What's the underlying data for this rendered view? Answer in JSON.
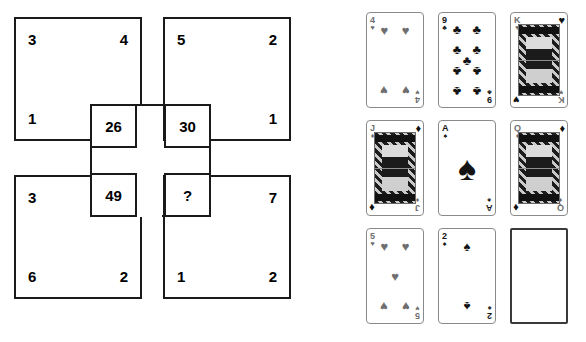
{
  "puzzle": {
    "squares": [
      {
        "id": "top-left",
        "top_left": "3",
        "top_right": "4",
        "bottom_left": "1",
        "bottom_right": ""
      },
      {
        "id": "top-right",
        "top_left": "5",
        "top_right": "2",
        "bottom_left": "",
        "bottom_right": "1"
      },
      {
        "id": "bottom-left",
        "top_left": "3",
        "top_right": "",
        "bottom_left": "6",
        "bottom_right": "2"
      },
      {
        "id": "bottom-right",
        "top_left": "",
        "top_right": "7",
        "bottom_left": "1",
        "bottom_right": "2"
      }
    ],
    "center_cells": [
      {
        "id": "cell-26",
        "value": "26"
      },
      {
        "id": "cell-30",
        "value": "30"
      },
      {
        "id": "cell-49",
        "value": "49"
      },
      {
        "id": "cell-q",
        "value": "?"
      }
    ]
  },
  "cards": {
    "rows": [
      [
        {
          "rank": "4",
          "suit_name": "hearts",
          "suit_glyph": "♥",
          "color": "red",
          "type": "pip",
          "pip_count": 4
        },
        {
          "rank": "9",
          "suit_name": "clubs",
          "suit_glyph": "♣",
          "color": "black",
          "type": "pip",
          "pip_count": 9
        },
        {
          "rank": "K",
          "suit_name": "hearts",
          "suit_glyph": "♥",
          "color": "red",
          "type": "court",
          "pip_count": 0
        }
      ],
      [
        {
          "rank": "J",
          "suit_name": "diamonds",
          "suit_glyph": "♦",
          "color": "red",
          "type": "court",
          "pip_count": 0
        },
        {
          "rank": "A",
          "suit_name": "spades",
          "suit_glyph": "♠",
          "color": "black",
          "type": "ace",
          "pip_count": 1
        },
        {
          "rank": "Q",
          "suit_name": "diamonds",
          "suit_glyph": "♦",
          "color": "red",
          "type": "court",
          "pip_count": 0
        }
      ],
      [
        {
          "rank": "5",
          "suit_name": "hearts",
          "suit_glyph": "♥",
          "color": "red",
          "type": "pip",
          "pip_count": 5
        },
        {
          "rank": "2",
          "suit_name": "spades",
          "suit_glyph": "♠",
          "color": "black",
          "type": "pip",
          "pip_count": 2
        },
        {
          "rank": "",
          "suit_name": "blank",
          "suit_glyph": "",
          "color": "black",
          "type": "blank",
          "pip_count": 0
        }
      ]
    ]
  },
  "colors": {
    "line": "#1a1a1a",
    "card_border": "#8a8a8a",
    "blank_card_border": "#3a3a3a",
    "red_suit": "#6e6e6e",
    "black_suit": "#141414",
    "background": "#ffffff"
  }
}
